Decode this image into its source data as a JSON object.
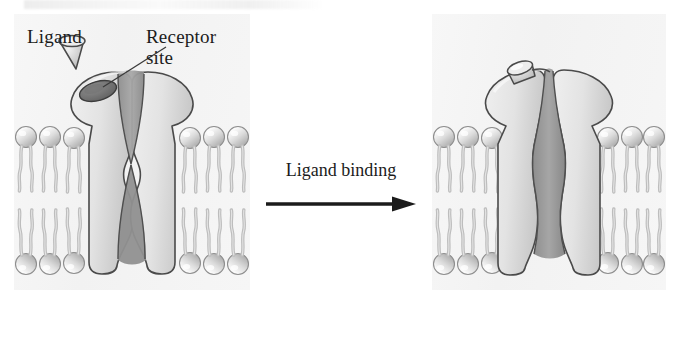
{
  "figure": {
    "panels": [
      {
        "id": "closed",
        "state_label": "closed",
        "position": "left",
        "description": "Ion channel protein embedded in phospholipid bilayer with pore closed; unbound ligand above the receptor site"
      },
      {
        "id": "open",
        "state_label": "open",
        "position": "right",
        "description": "Ion channel protein with ligand bound in the receptor site and the pore open"
      }
    ]
  },
  "labels": {
    "ligand": "Ligand",
    "receptor_site": "Receptor\nsite"
  },
  "transition": {
    "label": "Ligand binding",
    "arrow_direction": "right"
  },
  "colors": {
    "panel_background": "#f4f4f4",
    "protein_fill": "#e6e6e6",
    "protein_shadow": "#b9b9b9",
    "pore_fill": "#a0a0a0",
    "pore_deep": "#8a8a8a",
    "receptor_pocket": "#7d7d7d",
    "lipid_head": "#d8d8d8",
    "lipid_tail": "#c9c9c9",
    "outline": "#3a3a3a",
    "text": "#1b1b1b"
  },
  "structures": {
    "membrane": {
      "name": "phospholipid bilayer",
      "leaflets": 2,
      "head_group_shape": "sphere",
      "tail_shape": "wavy double chain"
    },
    "channel": {
      "closed_pore": "pinched shut at midline",
      "open_pore": "continuous conduit top to bottom"
    },
    "ligand": {
      "shape": "cone",
      "unbound_position": "above receptor site",
      "bound_position": "seated in receptor site"
    }
  }
}
